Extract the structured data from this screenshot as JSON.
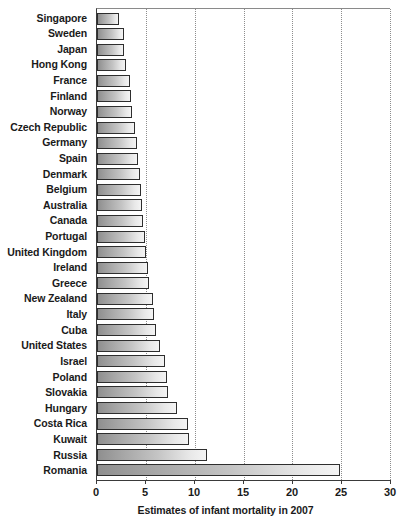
{
  "chart_data": {
    "type": "bar",
    "orientation": "horizontal",
    "title": "",
    "xlabel": "Estimates of infant mortality in 2007",
    "ylabel": "",
    "xlim": [
      0,
      30
    ],
    "xticks": [
      0,
      5,
      10,
      15,
      20,
      25,
      30
    ],
    "xtick_labels": [
      "0",
      "5",
      "10",
      "15",
      "20",
      "25",
      "30"
    ],
    "grid": "vertical-dotted",
    "legend": "none",
    "categories": [
      "Singapore",
      "Sweden",
      "Japan",
      "Hong Kong",
      "France",
      "Finland",
      "Norway",
      "Czech Republic",
      "Germany",
      "Spain",
      "Denmark",
      "Belgium",
      "Australia",
      "Canada",
      "Portugal",
      "United Kingdom",
      "Ireland",
      "Greece",
      "New Zealand",
      "Italy",
      "Cuba",
      "United States",
      "Israel",
      "Poland",
      "Slovakia",
      "Hungary",
      "Costa Rica",
      "Kuwait",
      "Russia",
      "Romania"
    ],
    "values": [
      2.3,
      2.8,
      2.8,
      3.0,
      3.4,
      3.5,
      3.6,
      3.9,
      4.1,
      4.2,
      4.4,
      4.5,
      4.6,
      4.7,
      4.9,
      5.0,
      5.2,
      5.3,
      5.7,
      5.8,
      6.0,
      6.4,
      7.0,
      7.2,
      7.3,
      8.2,
      9.3,
      9.4,
      11.3,
      24.9
    ],
    "accent": "#a8a8a8",
    "bar_border": "#2e2e2e",
    "gridline_color": "#8d8d8d",
    "axis_color": "#3a3a3a"
  }
}
